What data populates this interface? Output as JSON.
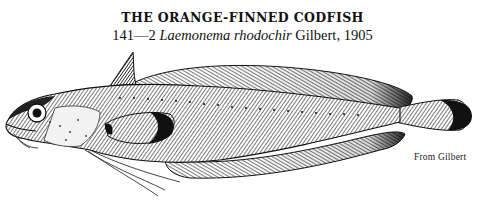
{
  "plate": {
    "title": "THE ORANGE-FINNED CODFISH",
    "subtitle": {
      "number": "141—2",
      "scientific_name": "Laemonema rhodochir",
      "authority": "Gilbert, 1905"
    },
    "credit": "From Gilbert"
  },
  "illustration": {
    "subject": "fish-engraving",
    "style": "black-and-white halftone engraving",
    "colors": {
      "ink": "#111111",
      "paper": "#ffffff",
      "mid": "#8a8a8a"
    }
  }
}
